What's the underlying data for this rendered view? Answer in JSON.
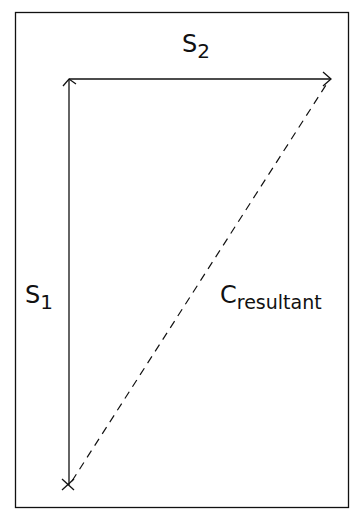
{
  "diagram": {
    "type": "vector-addition",
    "colors": {
      "stroke": "#111111",
      "background": "#ffffff"
    },
    "labels": {
      "s2": {
        "main": "S",
        "sub": "2"
      },
      "s1": {
        "main": "S",
        "sub": "1"
      },
      "resultant": {
        "main": "C",
        "sub": "resultant"
      }
    },
    "vectors": [
      {
        "name": "S1",
        "from": [
          69,
          485
        ],
        "to": [
          69,
          79
        ],
        "style": "solid",
        "arrow": "end"
      },
      {
        "name": "S2",
        "from": [
          69,
          79
        ],
        "to": [
          331,
          79
        ],
        "style": "solid",
        "arrow": "end"
      },
      {
        "name": "C_resultant",
        "from": [
          69,
          485
        ],
        "to": [
          327,
          83
        ],
        "style": "dashed",
        "arrow": "none"
      }
    ],
    "origin_marker": "x"
  }
}
